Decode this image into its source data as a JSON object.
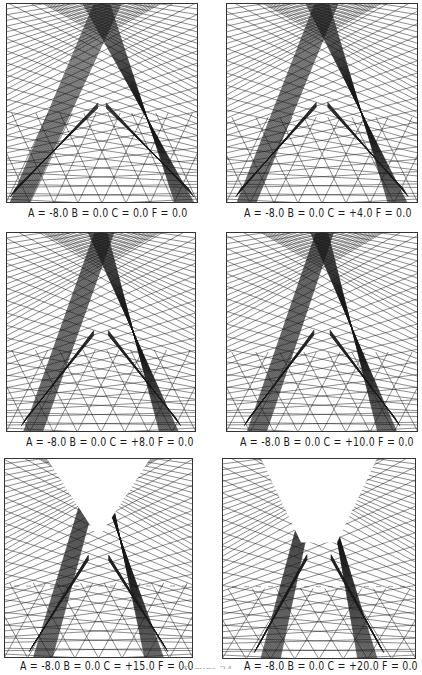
{
  "figure": {
    "partial_label": "Figure 24",
    "panels": [
      {
        "id": "p1",
        "A": "-8.0",
        "B": "0.0",
        "C": "0.0",
        "F": "0.0",
        "caption": "A = -8.0  B = 0.0  C = 0.0  F = 0.0",
        "box": [
          6,
          3,
          192,
          200
        ],
        "caption_pos": [
          28,
          207
        ],
        "c": 0
      },
      {
        "id": "p2",
        "A": "-8.0",
        "B": "0.0",
        "C": "+4.0",
        "F": "0.0",
        "caption": "A = -8.0  B = 0.0  C = +4.0  F = 0.0",
        "box": [
          226,
          3,
          192,
          200
        ],
        "caption_pos": [
          244,
          207
        ],
        "c": 4
      },
      {
        "id": "p3",
        "A": "-8.0",
        "B": "0.0",
        "C": "+8.0",
        "F": "0.0",
        "caption": "A = -8.0  B = 0.0  C = +8.0  F = 0.0",
        "box": [
          6,
          232,
          190,
          200
        ],
        "caption_pos": [
          26,
          436
        ],
        "c": 8
      },
      {
        "id": "p4",
        "A": "-8.0",
        "B": "0.0",
        "C": "+10.0",
        "F": "0.0",
        "caption": "A = -8.0  B = 0.0  C = +10.0  F = 0.0",
        "box": [
          226,
          232,
          192,
          200
        ],
        "caption_pos": [
          240,
          436
        ],
        "c": 10
      },
      {
        "id": "p5",
        "A": "-8.0",
        "B": "0.0",
        "C": "+15.0",
        "F": "0.0",
        "caption": "A = -8.0  B = 0.0  C = +15.0  F = 0.0",
        "box": [
          4,
          458,
          189,
          200
        ],
        "caption_pos": [
          20,
          660
        ],
        "c": 15
      },
      {
        "id": "p6",
        "A": "-8.0",
        "B": "0.0",
        "C": "+20.0",
        "F": "0.0",
        "caption": "A = -8.0  B = 0.0  C = +20.0  F = 0.0",
        "box": [
          222,
          458,
          194,
          201
        ],
        "caption_pos": [
          244,
          660
        ],
        "c": 20
      }
    ]
  },
  "colors": {
    "ink": "#1a1a1a",
    "paper": "#ffffff",
    "frame": "#333333"
  }
}
